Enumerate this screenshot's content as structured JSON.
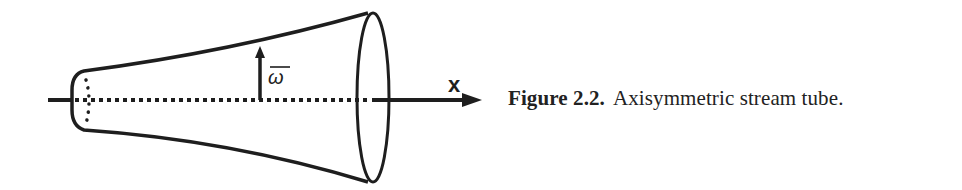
{
  "figure": {
    "axis_label": "x",
    "radius_label": "ω",
    "radius_label_overbar": true
  },
  "caption": {
    "label": "Figure 2.2.",
    "text": "Axisymmetric stream tube."
  },
  "colors": {
    "ink": "#1e1e1e",
    "background": "#ffffff"
  }
}
